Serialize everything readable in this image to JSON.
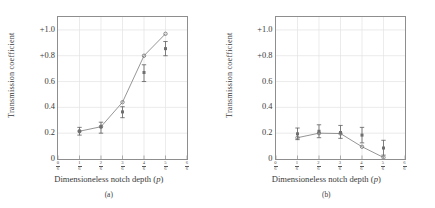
{
  "figure": {
    "panels": [
      {
        "caption": "(a)",
        "xlabel_text": "Dimensioneless notch depth (",
        "xlabel_var": "p",
        "xlabel_tail": ")",
        "ylabel": "Transmission coefficient"
      },
      {
        "caption": "(b)",
        "xlabel_text": "Dimensioneless notch depth (",
        "xlabel_var": "p",
        "xlabel_tail": ")",
        "ylabel": "Transmission coefficient"
      }
    ],
    "yticks": [
      "+1.0",
      "+0.8",
      "0.6",
      "0.4",
      "0.2",
      "0"
    ],
    "xticks": [
      {
        "num": "0",
        "den": "6"
      },
      {
        "num": "1",
        "den": "6"
      },
      {
        "num": "2",
        "den": "6"
      },
      {
        "num": "3",
        "den": "6"
      },
      {
        "num": "4",
        "den": "6"
      },
      {
        "num": "5",
        "den": "6"
      },
      {
        "num": "6",
        "den": "6"
      }
    ],
    "colors": {
      "line": "#8a8a8a",
      "marker": "#6f6f6f",
      "errorbar": "#5f5f5f",
      "grid": "#e2e2e2",
      "frame": "#8e8e8e",
      "text": "#3a3a3a"
    }
  },
  "chart_data": [
    {
      "type": "line",
      "title": "(a)",
      "xlabel": "Dimensioneless notch depth (p)",
      "ylabel": "Transmission coefficient",
      "xlim": [
        0,
        1
      ],
      "ylim": [
        0,
        1.1
      ],
      "xtick_values": [
        0,
        0.1667,
        0.3333,
        0.5,
        0.6667,
        0.8333,
        1
      ],
      "xtick_labels": [
        "0/6",
        "1/6",
        "2/6",
        "3/6",
        "4/6",
        "5/6",
        "6/6"
      ],
      "ytick_values": [
        0,
        0.2,
        0.4,
        0.6,
        0.8,
        1.0
      ],
      "ytick_labels": [
        "0",
        "0.2",
        "0.4",
        "0.6",
        "+0.8",
        "+1.0"
      ],
      "grid": true,
      "legend": "none",
      "series": [
        {
          "name": "theory",
          "marker": "circle",
          "x": [
            0.1667,
            0.3333,
            0.5,
            0.6667,
            0.8333
          ],
          "values": [
            0.215,
            0.25,
            0.44,
            0.8,
            0.97
          ]
        },
        {
          "name": "experiment",
          "marker": "square",
          "x": [
            0.1667,
            0.3333,
            0.5,
            0.6667,
            0.8333
          ],
          "values": [
            0.215,
            0.25,
            0.365,
            0.67,
            0.855
          ],
          "yerr_low": [
            0.03,
            0.05,
            0.045,
            0.07,
            0.055
          ],
          "yerr_high": [
            0.03,
            0.035,
            0.04,
            0.06,
            0.055
          ]
        }
      ]
    },
    {
      "type": "line",
      "title": "(b)",
      "xlabel": "Dimensioneless notch depth (p)",
      "ylabel": "Transmission coefficient",
      "xlim": [
        0,
        1
      ],
      "ylim": [
        0,
        1.1
      ],
      "xtick_values": [
        0,
        0.1667,
        0.3333,
        0.5,
        0.6667,
        0.8333,
        1
      ],
      "xtick_labels": [
        "0/6",
        "1/6",
        "2/6",
        "3/6",
        "4/6",
        "5/6",
        "6/6"
      ],
      "ytick_values": [
        0,
        0.2,
        0.4,
        0.6,
        0.8,
        1.0
      ],
      "ytick_labels": [
        "0",
        "0.2",
        "0.4",
        "0.6",
        "+0.8",
        "+1.0"
      ],
      "grid": true,
      "legend": "none",
      "series": [
        {
          "name": "theory",
          "marker": "circle",
          "x": [
            0.1667,
            0.3333,
            0.5,
            0.6667,
            0.8333
          ],
          "values": [
            0.165,
            0.2,
            0.197,
            0.095,
            0.012
          ]
        },
        {
          "name": "experiment",
          "marker": "square",
          "x": [
            0.1667,
            0.3333,
            0.5,
            0.6667,
            0.8333
          ],
          "values": [
            0.195,
            0.215,
            0.205,
            0.185,
            0.085
          ],
          "yerr_low": [
            0.045,
            0.05,
            0.045,
            0.06,
            0.055
          ],
          "yerr_high": [
            0.045,
            0.05,
            0.055,
            0.06,
            0.06
          ]
        }
      ]
    }
  ]
}
